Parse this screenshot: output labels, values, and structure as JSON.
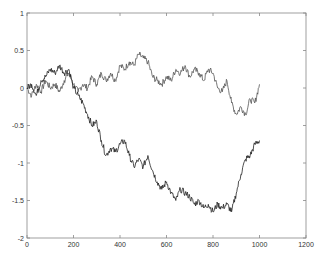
{
  "chart_data": {
    "type": "line",
    "title": "",
    "xlabel": "",
    "ylabel": "",
    "xlim": [
      0,
      1200
    ],
    "ylim": [
      -2,
      1
    ],
    "xticks": [
      0,
      200,
      400,
      600,
      800,
      1000,
      1200
    ],
    "yticks": [
      -2,
      -1.5,
      -1,
      -0.5,
      0,
      0.5,
      1
    ],
    "xtick_labels": [
      "0",
      "200",
      "400",
      "600",
      "800",
      "1000",
      "1200"
    ],
    "ytick_labels": [
      "-2",
      "-1.5",
      "-1",
      "-0.5",
      "0",
      "0.5",
      "1"
    ],
    "grid": false,
    "legend": null,
    "series": [
      {
        "name": "walk 1",
        "color": "#555555",
        "x": [
          0,
          20,
          40,
          60,
          80,
          100,
          120,
          140,
          160,
          180,
          200,
          220,
          240,
          260,
          280,
          300,
          320,
          340,
          360,
          380,
          400,
          420,
          440,
          460,
          480,
          500,
          520,
          540,
          560,
          580,
          600,
          620,
          640,
          660,
          680,
          700,
          720,
          740,
          760,
          780,
          800,
          820,
          840,
          860,
          880,
          900,
          920,
          940,
          960,
          980,
          1000
        ],
        "values": [
          0,
          -0.1,
          0.05,
          -0.05,
          0.1,
          0.0,
          0.05,
          -0.05,
          0.1,
          0.2,
          0.05,
          -0.05,
          0.05,
          0.0,
          0.15,
          0.05,
          0.2,
          0.1,
          0.2,
          0.1,
          0.3,
          0.25,
          0.35,
          0.3,
          0.45,
          0.4,
          0.35,
          0.15,
          0.1,
          0.05,
          0.15,
          0.1,
          0.25,
          0.2,
          0.3,
          0.15,
          0.25,
          0.2,
          0.1,
          0.25,
          0.2,
          0.0,
          -0.05,
          0.1,
          -0.2,
          -0.35,
          -0.25,
          -0.35,
          -0.15,
          -0.2,
          0.05
        ]
      },
      {
        "name": "walk 2",
        "color": "#222222",
        "x": [
          0,
          20,
          40,
          60,
          80,
          100,
          120,
          140,
          160,
          180,
          200,
          220,
          240,
          260,
          280,
          300,
          320,
          340,
          360,
          380,
          400,
          420,
          440,
          460,
          480,
          500,
          520,
          540,
          560,
          580,
          600,
          620,
          640,
          660,
          680,
          700,
          720,
          740,
          760,
          780,
          800,
          820,
          840,
          860,
          880,
          900,
          920,
          940,
          960,
          980,
          1000
        ],
        "values": [
          0,
          0.05,
          -0.1,
          0.1,
          0.15,
          0.25,
          0.2,
          0.3,
          0.2,
          0.25,
          0.0,
          -0.1,
          -0.2,
          -0.35,
          -0.5,
          -0.45,
          -0.7,
          -0.9,
          -0.8,
          -0.85,
          -0.75,
          -0.7,
          -0.9,
          -1.05,
          -0.95,
          -1.05,
          -0.9,
          -1.1,
          -1.25,
          -1.35,
          -1.25,
          -1.4,
          -1.5,
          -1.35,
          -1.4,
          -1.45,
          -1.55,
          -1.5,
          -1.6,
          -1.55,
          -1.65,
          -1.55,
          -1.6,
          -1.55,
          -1.65,
          -1.4,
          -1.15,
          -0.95,
          -0.9,
          -0.75,
          -0.7
        ]
      }
    ]
  }
}
